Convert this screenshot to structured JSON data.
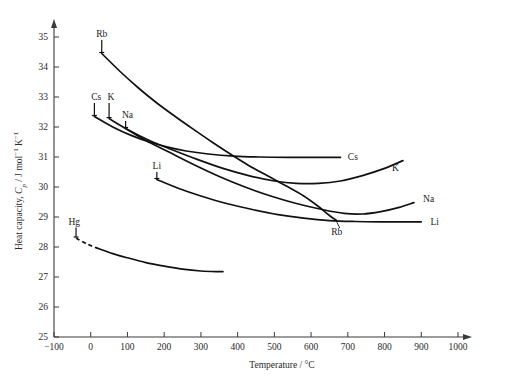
{
  "chart_data": {
    "type": "line",
    "title": "",
    "xlabel": "Temperature / °C",
    "ylabel": "Heat capacity, Cₚ / J mol⁻¹ K⁻¹",
    "ylabel_parts": {
      "prefix": "Heat capacity, ",
      "symbol": "C",
      "subscript": "p",
      "units": " / J mol",
      "sup1": "−1",
      "units2": " K",
      "sup2": "−1"
    },
    "xlim": [
      -100,
      1000
    ],
    "ylim": [
      25,
      35
    ],
    "xticks": [
      -100,
      0,
      100,
      200,
      300,
      400,
      500,
      600,
      700,
      800,
      900,
      1000
    ],
    "xtick_labels": [
      "−100",
      "0",
      "100",
      "200",
      "300",
      "400",
      "500",
      "600",
      "700",
      "800",
      "900",
      "1000"
    ],
    "yticks": [
      25,
      26,
      27,
      28,
      29,
      30,
      31,
      32,
      33,
      34,
      35
    ],
    "ytick_labels": [
      "25",
      "26",
      "27",
      "28",
      "29",
      "30",
      "31",
      "32",
      "33",
      "34",
      "35"
    ],
    "grid": false,
    "legend": "inline-labels",
    "axis_color": "#3a3a3a",
    "curve_color": "#111111",
    "series": [
      {
        "name": "Rb",
        "label_start": "Rb",
        "label_end": "Rb",
        "start_label_pos": {
          "x": 30,
          "y": 35.0
        },
        "end_label_pos": {
          "x": 670,
          "y": 28.4
        },
        "points": [
          [
            30,
            34.45
          ],
          [
            80,
            33.85
          ],
          [
            130,
            33.3
          ],
          [
            180,
            32.8
          ],
          [
            230,
            32.35
          ],
          [
            280,
            31.92
          ],
          [
            330,
            31.5
          ],
          [
            380,
            31.1
          ],
          [
            430,
            30.72
          ],
          [
            480,
            30.38
          ],
          [
            530,
            30.05
          ],
          [
            580,
            29.7
          ],
          [
            620,
            29.35
          ],
          [
            650,
            29.05
          ],
          [
            670,
            28.88
          ]
        ]
      },
      {
        "name": "Cs",
        "label_start": "Cs",
        "label_end": "Cs",
        "start_label_pos": {
          "x": 15,
          "y": 32.9
        },
        "end_label_pos": {
          "x": 700,
          "y": 31.0
        },
        "points": [
          [
            10,
            32.35
          ],
          [
            60,
            32.0
          ],
          [
            110,
            31.72
          ],
          [
            160,
            31.5
          ],
          [
            210,
            31.33
          ],
          [
            260,
            31.2
          ],
          [
            320,
            31.1
          ],
          [
            390,
            31.03
          ],
          [
            460,
            31.0
          ],
          [
            540,
            30.99
          ],
          [
            620,
            30.99
          ],
          [
            680,
            30.99
          ]
        ]
      },
      {
        "name": "K",
        "label_start": "K",
        "label_end": "K",
        "start_label_pos": {
          "x": 55,
          "y": 32.9
        },
        "end_label_pos": {
          "x": 820,
          "y": 30.65
        },
        "points": [
          [
            50,
            32.28
          ],
          [
            100,
            31.92
          ],
          [
            160,
            31.55
          ],
          [
            220,
            31.25
          ],
          [
            290,
            30.92
          ],
          [
            360,
            30.62
          ],
          [
            430,
            30.38
          ],
          [
            500,
            30.2
          ],
          [
            560,
            30.12
          ],
          [
            620,
            30.12
          ],
          [
            680,
            30.2
          ],
          [
            740,
            30.38
          ],
          [
            800,
            30.62
          ],
          [
            850,
            30.88
          ]
        ]
      },
      {
        "name": "Na",
        "label_start": "Na",
        "label_end": "Na",
        "start_label_pos": {
          "x": 100,
          "y": 32.3
        },
        "end_label_pos": {
          "x": 905,
          "y": 29.6
        },
        "points": [
          [
            95,
            31.95
          ],
          [
            150,
            31.55
          ],
          [
            210,
            31.18
          ],
          [
            280,
            30.75
          ],
          [
            350,
            30.35
          ],
          [
            420,
            30.0
          ],
          [
            490,
            29.7
          ],
          [
            560,
            29.45
          ],
          [
            630,
            29.25
          ],
          [
            690,
            29.12
          ],
          [
            740,
            29.1
          ],
          [
            790,
            29.18
          ],
          [
            840,
            29.32
          ],
          [
            880,
            29.48
          ]
        ]
      },
      {
        "name": "Li",
        "label_start": "Li",
        "label_end": "Li",
        "start_label_pos": {
          "x": 180,
          "y": 30.6
        },
        "end_label_pos": {
          "x": 925,
          "y": 28.85
        },
        "points": [
          [
            180,
            30.25
          ],
          [
            240,
            29.95
          ],
          [
            300,
            29.7
          ],
          [
            370,
            29.45
          ],
          [
            440,
            29.25
          ],
          [
            510,
            29.08
          ],
          [
            580,
            28.96
          ],
          [
            650,
            28.88
          ],
          [
            720,
            28.85
          ],
          [
            790,
            28.84
          ],
          [
            860,
            28.84
          ],
          [
            900,
            28.84
          ]
        ]
      },
      {
        "name": "Hg",
        "label_start": "Hg",
        "label_end": "",
        "start_label_pos": {
          "x": -45,
          "y": 28.75
        },
        "extrapolated_segment": [
          [
            -40,
            28.3
          ],
          [
            -10,
            28.1
          ],
          [
            20,
            27.95
          ]
        ],
        "points": [
          [
            20,
            27.95
          ],
          [
            60,
            27.78
          ],
          [
            100,
            27.64
          ],
          [
            150,
            27.48
          ],
          [
            200,
            27.36
          ],
          [
            250,
            27.26
          ],
          [
            300,
            27.2
          ],
          [
            350,
            27.18
          ],
          [
            360,
            27.18
          ]
        ]
      }
    ]
  }
}
